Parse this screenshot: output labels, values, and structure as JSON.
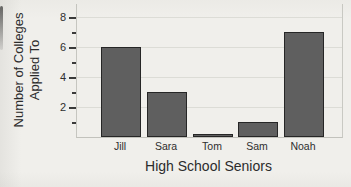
{
  "figure": {
    "background_color": "#f0efeb"
  },
  "chart_data": {
    "type": "bar",
    "categories": [
      "Jill",
      "Sara",
      "Tom",
      "Sam",
      "Noah"
    ],
    "values": [
      6,
      3,
      0.1,
      1,
      7
    ],
    "title": "",
    "xlabel": "High School Seniors",
    "ylabel": "Number of Colleges Applied To",
    "ylabel_lines": [
      "Number of Colleges",
      "Applied To"
    ],
    "ylim": [
      0,
      8.8
    ],
    "yticks_major": [
      2,
      4,
      6,
      8
    ],
    "yticks_minor": [
      1,
      3,
      5,
      7
    ],
    "ytick_labels": [
      "2",
      "4",
      "6",
      "8"
    ],
    "grid": "horizontal-major",
    "legend": "none",
    "bar_color": "#5f5f5f",
    "bar_border_color": "#262626",
    "grid_color": "#dcdcd6",
    "axis_border_color": "#c6c6c0",
    "tick_color": "#3a3a3a",
    "text_color": "#2b2b2b"
  }
}
